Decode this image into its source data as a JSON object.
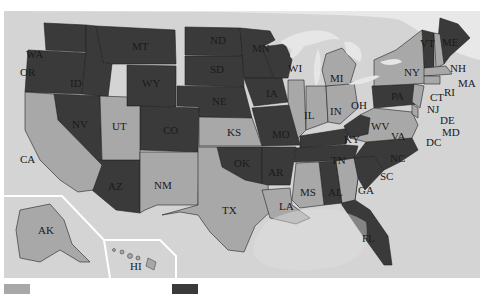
{
  "map": {
    "type": "choropleth",
    "region": "United States",
    "colors": {
      "dark": "#3a3a3a",
      "light": "#a8a8a8",
      "water": "#d4d4d4",
      "lakes": "#e6e6e6",
      "inset_border": "#ffffff"
    },
    "states": [
      {
        "abbr": "WA",
        "shade": "dark"
      },
      {
        "abbr": "OR",
        "shade": "dark"
      },
      {
        "abbr": "CA",
        "shade": "light"
      },
      {
        "abbr": "ID",
        "shade": "dark"
      },
      {
        "abbr": "NV",
        "shade": "dark"
      },
      {
        "abbr": "MT",
        "shade": "dark"
      },
      {
        "abbr": "WY",
        "shade": "dark"
      },
      {
        "abbr": "UT",
        "shade": "light"
      },
      {
        "abbr": "AZ",
        "shade": "dark"
      },
      {
        "abbr": "CO",
        "shade": "dark"
      },
      {
        "abbr": "NM",
        "shade": "light"
      },
      {
        "abbr": "ND",
        "shade": "dark"
      },
      {
        "abbr": "SD",
        "shade": "dark"
      },
      {
        "abbr": "NE",
        "shade": "dark"
      },
      {
        "abbr": "KS",
        "shade": "light"
      },
      {
        "abbr": "OK",
        "shade": "dark"
      },
      {
        "abbr": "TX",
        "shade": "light"
      },
      {
        "abbr": "MN",
        "shade": "dark"
      },
      {
        "abbr": "IA",
        "shade": "dark"
      },
      {
        "abbr": "MO",
        "shade": "dark"
      },
      {
        "abbr": "AR",
        "shade": "dark"
      },
      {
        "abbr": "LA",
        "shade": "light"
      },
      {
        "abbr": "WI",
        "shade": "dark"
      },
      {
        "abbr": "IL",
        "shade": "light"
      },
      {
        "abbr": "MS",
        "shade": "light"
      },
      {
        "abbr": "MI",
        "shade": "light"
      },
      {
        "abbr": "IN",
        "shade": "light"
      },
      {
        "abbr": "KY",
        "shade": "dark"
      },
      {
        "abbr": "TN",
        "shade": "dark"
      },
      {
        "abbr": "AL",
        "shade": "dark"
      },
      {
        "abbr": "OH",
        "shade": "light"
      },
      {
        "abbr": "WV",
        "shade": "dark"
      },
      {
        "abbr": "GA",
        "shade": "light"
      },
      {
        "abbr": "FL",
        "shade": "dark"
      },
      {
        "abbr": "SC",
        "shade": "dark"
      },
      {
        "abbr": "NC",
        "shade": "dark"
      },
      {
        "abbr": "VA",
        "shade": "light"
      },
      {
        "abbr": "PA",
        "shade": "dark"
      },
      {
        "abbr": "NY",
        "shade": "light"
      },
      {
        "abbr": "VT",
        "shade": "dark"
      },
      {
        "abbr": "NH",
        "shade": "light"
      },
      {
        "abbr": "ME",
        "shade": "dark"
      },
      {
        "abbr": "MA",
        "shade": "light"
      },
      {
        "abbr": "RI",
        "shade": "light"
      },
      {
        "abbr": "CT",
        "shade": "light"
      },
      {
        "abbr": "NJ",
        "shade": "light"
      },
      {
        "abbr": "DE",
        "shade": "light"
      },
      {
        "abbr": "MD",
        "shade": "light"
      },
      {
        "abbr": "DC",
        "shade": "light"
      },
      {
        "abbr": "AK",
        "shade": "light"
      },
      {
        "abbr": "HI",
        "shade": "light"
      }
    ],
    "labels": {
      "WA": "WA",
      "OR": "OR",
      "CA": "CA",
      "ID": "ID",
      "NV": "NV",
      "MT": "MT",
      "WY": "WY",
      "UT": "UT",
      "AZ": "AZ",
      "CO": "CO",
      "NM": "NM",
      "ND": "ND",
      "SD": "SD",
      "NE": "NE",
      "KS": "KS",
      "OK": "OK",
      "TX": "TX",
      "MN": "MN",
      "IA": "IA",
      "MO": "MO",
      "AR": "AR",
      "LA": "LA",
      "WI": "WI",
      "IL": "IL",
      "MS": "MS",
      "MI": "MI",
      "IN": "IN",
      "KY": "KY",
      "TN": "TN",
      "AL": "AL",
      "OH": "OH",
      "WV": "WV",
      "GA": "GA",
      "FL": "FL",
      "SC": "SC",
      "NC": "NC",
      "VA": "VA",
      "PA": "PA",
      "NY": "NY",
      "VT": "VT",
      "NH": "NH",
      "ME": "ME",
      "MA": "MA",
      "RI": "RI",
      "CT": "CT",
      "NJ": "NJ",
      "DE": "DE",
      "MD": "MD",
      "DC": "DC",
      "AK": "AK",
      "HI": "HI"
    }
  },
  "legend": {
    "items": [
      {
        "shade": "light",
        "color": "#a8a8a8"
      },
      {
        "shade": "dark",
        "color": "#3a3a3a"
      }
    ]
  }
}
